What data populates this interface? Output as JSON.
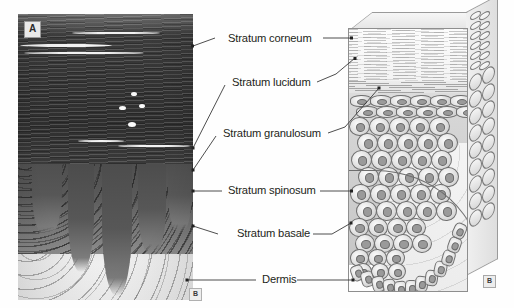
{
  "figure": {
    "panel_a_label": "A",
    "panel_b_label": "B",
    "panel_b_label_2": "B"
  },
  "labels": [
    {
      "id": "stratum-corneum",
      "text": "Stratum corneum",
      "x": 228,
      "y": 34
    },
    {
      "id": "stratum-lucidum",
      "text": "Stratum lucidum",
      "x": 232,
      "y": 81
    },
    {
      "id": "stratum-granulosum",
      "text": "Stratum granulosum",
      "x": 223,
      "y": 132
    },
    {
      "id": "stratum-spinosum",
      "text": "Stratum spinosum",
      "x": 228,
      "y": 187
    },
    {
      "id": "stratum-basale",
      "text": "Stratum basale",
      "x": 237,
      "y": 230
    },
    {
      "id": "dermis",
      "text": "Dermis",
      "x": 262,
      "y": 273
    }
  ],
  "colors": {
    "text": "#231f20",
    "leader": "#3a3a3a",
    "background": "#ffffff",
    "micrograph_corneum": "#333333",
    "micrograph_dermis": "#f0f0f0",
    "illustration_fill": "#d6d6d6"
  },
  "panels": {
    "left": {
      "name": "histology-micrograph",
      "caption": "A"
    },
    "right": {
      "name": "epidermis-block-diagram",
      "caption": "B"
    }
  }
}
